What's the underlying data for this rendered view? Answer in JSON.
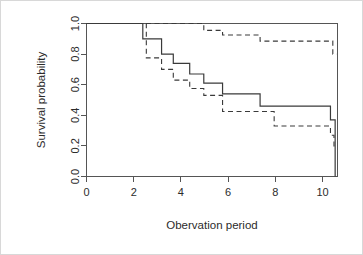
{
  "chart_data": {
    "type": "line",
    "title": "",
    "xlabel": "Obervation period",
    "ylabel": "Survival probability",
    "xlim": [
      0,
      10.7
    ],
    "ylim": [
      0.0,
      1.0
    ],
    "xticks": [
      0,
      2,
      4,
      6,
      8,
      10
    ],
    "xtick_labels": [
      "0",
      "2",
      "4",
      "6",
      "8",
      "10"
    ],
    "yticks": [
      0.0,
      0.2,
      0.4,
      0.6,
      0.8,
      1.0
    ],
    "ytick_labels": [
      "0.0",
      "0.2",
      "0.4",
      "0.6",
      "0.8",
      "1.0"
    ],
    "grid": false,
    "legend": "none",
    "step_type": "post",
    "series": [
      {
        "name": "Kaplan-Meier estimate",
        "style": "solid",
        "x": [
          0.0,
          2.4,
          3.2,
          3.7,
          4.4,
          5.0,
          5.8,
          7.4,
          8.0,
          10.4,
          10.6
        ],
        "values": [
          1.0,
          0.9,
          0.8,
          0.74,
          0.67,
          0.61,
          0.54,
          0.46,
          0.46,
          0.37,
          0.0
        ]
      },
      {
        "name": "Upper confidence limit",
        "style": "dashed",
        "x": [
          0.0,
          2.4,
          4.4,
          5.0,
          5.8,
          7.4,
          8.0,
          10.5
        ],
        "values": [
          1.0,
          1.0,
          1.0,
          0.955,
          0.925,
          0.885,
          0.885,
          0.8
        ]
      },
      {
        "name": "Lower confidence limit",
        "style": "dashed",
        "x": [
          0.0,
          2.4,
          2.55,
          3.2,
          3.7,
          4.4,
          5.0,
          5.8,
          7.4,
          8.0,
          10.4,
          10.55
        ],
        "values": [
          1.0,
          1.0,
          0.775,
          0.7,
          0.63,
          0.575,
          0.53,
          0.425,
          0.425,
          0.33,
          0.27,
          0.2
        ]
      }
    ]
  }
}
